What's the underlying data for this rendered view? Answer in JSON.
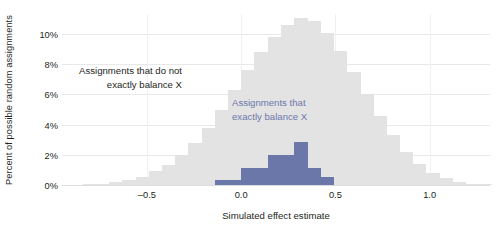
{
  "chart_data": {
    "type": "bar",
    "title": "",
    "subtitle": "",
    "xlabel": "Simulated effect estimate",
    "ylabel": "Percent of possible random assignments",
    "xlim": [
      -0.95,
      1.32
    ],
    "ylim": [
      0,
      11.4
    ],
    "grid": true,
    "legend_position": "inline-annotation",
    "bin_width": 0.07,
    "xticks": [
      -0.5,
      0.0,
      0.5,
      1.0
    ],
    "xtick_labels": [
      "–0.5",
      "0.0",
      "0.5",
      "1.0"
    ],
    "yticks": [
      0,
      2,
      4,
      6,
      8,
      10
    ],
    "ytick_labels": [
      "0%",
      "2%",
      "4%",
      "6%",
      "8%",
      "10%"
    ],
    "annotations": [
      {
        "name": "gray-series-annotation",
        "text": "Assignments that do not\nexactly balance X",
        "color": "#231f20",
        "align": "right"
      },
      {
        "name": "blue-series-annotation",
        "text": "Assignments that\nexactly balance X",
        "color": "#6c77a9",
        "align": "left"
      }
    ],
    "series": [
      {
        "name": "Assignments that do not exactly balance X",
        "color": "#e3e3e4",
        "x": [
          -0.875,
          -0.805,
          -0.735,
          -0.665,
          -0.595,
          -0.525,
          -0.455,
          -0.385,
          -0.315,
          -0.245,
          -0.175,
          -0.105,
          -0.035,
          0.035,
          0.105,
          0.175,
          0.245,
          0.315,
          0.385,
          0.455,
          0.525,
          0.595,
          0.665,
          0.735,
          0.805,
          0.875,
          0.945,
          1.015,
          1.085,
          1.155,
          1.225,
          1.295
        ],
        "values": [
          0.0,
          0.05,
          0.1,
          0.18,
          0.3,
          0.55,
          0.9,
          1.35,
          2.0,
          2.8,
          3.8,
          5.0,
          6.3,
          7.6,
          8.8,
          9.8,
          10.6,
          11.1,
          10.9,
          10.1,
          8.9,
          7.5,
          6.0,
          4.6,
          3.3,
          2.2,
          1.4,
          0.8,
          0.45,
          0.22,
          0.1,
          0.1
        ]
      },
      {
        "name": "Assignments that exactly balance X",
        "color": "#6c77a9",
        "x": [
          -0.175,
          -0.105,
          -0.035,
          0.035,
          0.105,
          0.175,
          0.245,
          0.315,
          0.385,
          0.455
        ],
        "values": [
          0.0,
          0.35,
          0.35,
          1.1,
          1.1,
          2.0,
          2.0,
          2.85,
          1.15,
          0.55
        ]
      }
    ]
  }
}
